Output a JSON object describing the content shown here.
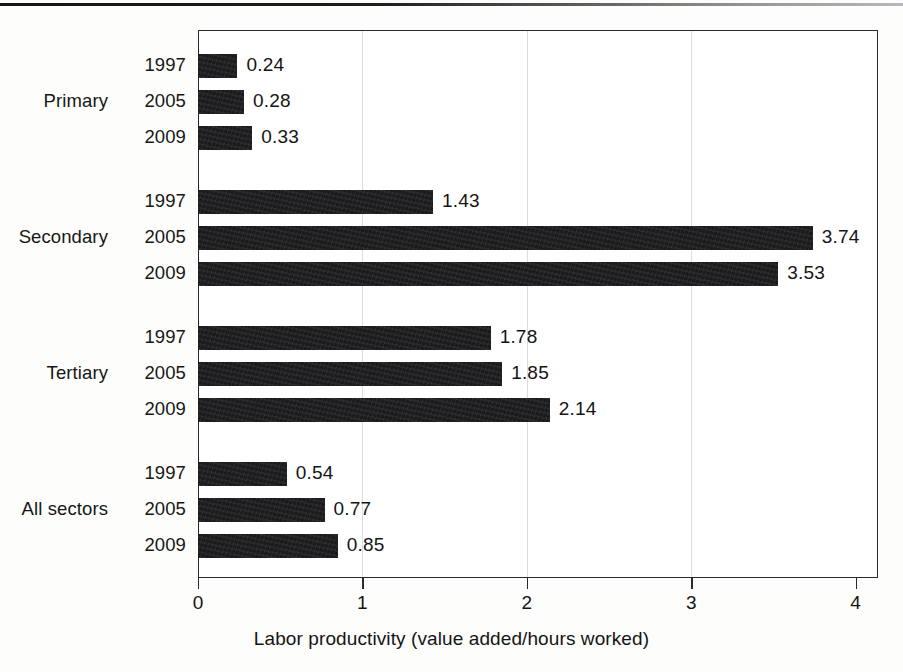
{
  "page": {
    "has_top_rule": true,
    "background_color": "#fdfdfc",
    "ink_color": "#1b1b1d"
  },
  "chart_data": {
    "type": "bar",
    "orientation": "horizontal",
    "title": "",
    "subtitle": "",
    "xlabel": "Labor productivity (value added/hours worked)",
    "ylabel": "",
    "xlim": [
      0,
      4
    ],
    "xticks": [
      "0",
      "1",
      "2",
      "3",
      "4"
    ],
    "xtick_values": [
      0,
      1,
      2,
      3,
      4
    ],
    "grid": "vertical-faint",
    "legend": "none",
    "bar_color": "#1b1b1d",
    "groups": [
      {
        "name": "Primary",
        "bars": [
          {
            "year": "1997",
            "value": 0.24,
            "label": "0.24"
          },
          {
            "year": "2005",
            "value": 0.28,
            "label": "0.28"
          },
          {
            "year": "2009",
            "value": 0.33,
            "label": "0.33"
          }
        ]
      },
      {
        "name": "Secondary",
        "bars": [
          {
            "year": "1997",
            "value": 1.43,
            "label": "1.43"
          },
          {
            "year": "2005",
            "value": 3.74,
            "label": "3.74"
          },
          {
            "year": "2009",
            "value": 3.53,
            "label": "3.53"
          }
        ]
      },
      {
        "name": "Tertiary",
        "bars": [
          {
            "year": "1997",
            "value": 1.78,
            "label": "1.78"
          },
          {
            "year": "2005",
            "value": 1.85,
            "label": "1.85"
          },
          {
            "year": "2009",
            "value": 2.14,
            "label": "2.14"
          }
        ]
      },
      {
        "name": "All sectors",
        "bars": [
          {
            "year": "1997",
            "value": 0.54,
            "label": "0.54"
          },
          {
            "year": "2005",
            "value": 0.77,
            "label": "0.77"
          },
          {
            "year": "2009",
            "value": 0.85,
            "label": "0.85"
          }
        ]
      }
    ]
  },
  "layout": {
    "plot_left": 198,
    "plot_top": 30,
    "plot_right": 878,
    "plot_bottom": 578,
    "px_per_unit": 164.4,
    "bar_height": 24,
    "bar_pitch": 36,
    "group_pitch": 136,
    "first_bar_top": 54
  }
}
